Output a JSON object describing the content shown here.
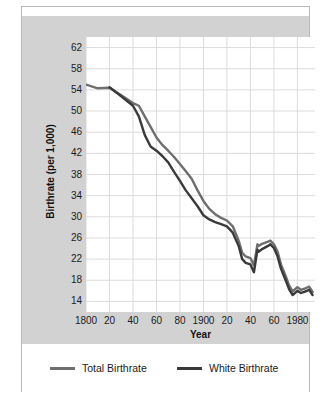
{
  "chart_data": {
    "type": "line",
    "title": "",
    "xlabel": "Year",
    "ylabel": "Birthrate (per 1,000)",
    "xlim": [
      1800,
      1995
    ],
    "ylim": [
      12,
      64
    ],
    "grid": true,
    "legend_position": "bottom",
    "xticks": [
      {
        "value": 1800,
        "label": "1800"
      },
      {
        "value": 1820,
        "label": "20"
      },
      {
        "value": 1840,
        "label": "40"
      },
      {
        "value": 1860,
        "label": "60"
      },
      {
        "value": 1880,
        "label": "80"
      },
      {
        "value": 1900,
        "label": "1900"
      },
      {
        "value": 1920,
        "label": "20"
      },
      {
        "value": 1940,
        "label": "40"
      },
      {
        "value": 1960,
        "label": "60"
      },
      {
        "value": 1980,
        "label": "1980"
      }
    ],
    "yticks": [
      {
        "value": 62,
        "label": "62"
      },
      {
        "value": 58,
        "label": "58"
      },
      {
        "value": 54,
        "label": "54"
      },
      {
        "value": 50,
        "label": "50"
      },
      {
        "value": 46,
        "label": "46"
      },
      {
        "value": 42,
        "label": "42"
      },
      {
        "value": 38,
        "label": "38"
      },
      {
        "value": 34,
        "label": "34"
      },
      {
        "value": 30,
        "label": "30"
      },
      {
        "value": 26,
        "label": "26"
      },
      {
        "value": 22,
        "label": "22"
      },
      {
        "value": 18,
        "label": "18"
      },
      {
        "value": 14,
        "label": "14"
      }
    ],
    "series": [
      {
        "name": "Total Birthrate",
        "color": "#6e6e6e",
        "x": [
          1800,
          1810,
          1820,
          1830,
          1840,
          1845,
          1850,
          1855,
          1860,
          1865,
          1870,
          1875,
          1880,
          1885,
          1890,
          1895,
          1900,
          1905,
          1910,
          1915,
          1920,
          1925,
          1930,
          1933,
          1936,
          1940,
          1943,
          1946,
          1947,
          1950,
          1955,
          1957,
          1960,
          1963,
          1966,
          1970,
          1973,
          1976,
          1980,
          1983,
          1986,
          1990,
          1993
        ],
        "y": [
          55.0,
          54.3,
          54.4,
          53.0,
          51.5,
          51.0,
          49.0,
          47.0,
          45.0,
          43.6,
          42.5,
          41.3,
          40.0,
          38.6,
          37.2,
          35.0,
          33.0,
          31.5,
          30.5,
          29.8,
          29.3,
          28.2,
          25.5,
          23.2,
          22.5,
          22.2,
          20.8,
          24.8,
          24.5,
          24.9,
          25.3,
          25.5,
          24.8,
          23.5,
          21.0,
          18.8,
          17.0,
          15.9,
          16.7,
          16.2,
          16.4,
          16.8,
          15.8
        ]
      },
      {
        "name": "White Birthrate",
        "color": "#3a3a3a",
        "x": [
          1820,
          1830,
          1840,
          1845,
          1850,
          1855,
          1860,
          1865,
          1870,
          1875,
          1880,
          1885,
          1890,
          1895,
          1900,
          1905,
          1910,
          1915,
          1920,
          1925,
          1930,
          1933,
          1936,
          1940,
          1943,
          1946,
          1947,
          1950,
          1955,
          1957,
          1960,
          1963,
          1966,
          1970,
          1973,
          1976,
          1980,
          1983,
          1986,
          1990,
          1993
        ],
        "y": [
          54.5,
          52.8,
          51.0,
          49.0,
          45.5,
          43.3,
          42.5,
          41.5,
          40.3,
          38.5,
          36.8,
          35.0,
          33.5,
          32.0,
          30.3,
          29.5,
          29.0,
          28.6,
          28.2,
          27.0,
          24.5,
          22.0,
          21.3,
          21.0,
          19.5,
          23.8,
          23.4,
          23.9,
          24.5,
          24.8,
          24.1,
          22.6,
          20.2,
          18.0,
          16.3,
          15.2,
          16.0,
          15.6,
          15.8,
          16.2,
          15.2
        ]
      }
    ],
    "legend": [
      {
        "label": "Total Birthrate",
        "color": "#6e6e6e"
      },
      {
        "label": "White Birthrate",
        "color": "#3a3a3a"
      }
    ]
  }
}
